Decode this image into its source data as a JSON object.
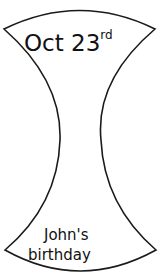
{
  "label": {
    "top_text": "Oct 23",
    "top_superscript": "rd",
    "bottom_line1": "John's",
    "bottom_line2": "birthday"
  },
  "colors": {
    "stroke": "#1a1a1a",
    "background": "#ffffff"
  }
}
